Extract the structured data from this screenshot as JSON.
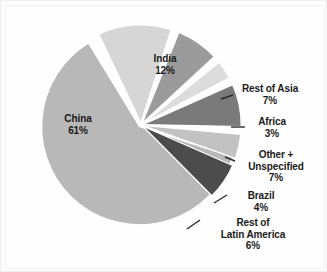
{
  "chart_data": {
    "type": "pie",
    "title": "",
    "subtitle": "",
    "xlabel": "",
    "ylabel": "",
    "legend_position": "none",
    "grid": false,
    "categories": [
      "China",
      "India",
      "Rest of Asia",
      "Africa",
      "Other + Unspecified",
      "Brazil",
      "Rest of Latin America"
    ],
    "values": [
      61,
      12,
      7,
      3,
      7,
      4,
      6
    ],
    "unit": "%",
    "slices": [
      {
        "label": "China",
        "value": 61,
        "value_text": "61%",
        "color": "#b8b8b8",
        "start_deg": 108,
        "end_deg": 328.6
      },
      {
        "label": "India",
        "value": 12,
        "value_text": "12%",
        "color": "#d6d6d6",
        "start_deg": 334.6,
        "end_deg": 378.0
      },
      {
        "label": "Rest of Asia",
        "value": 7,
        "value_text": "7%",
        "color": "#9b9b9b",
        "start_deg": 382.0,
        "end_deg": 407.2
      },
      {
        "label": "Africa",
        "value": 3,
        "value_text": "3%",
        "color": "#dcdcdc",
        "start_deg": 411.2,
        "end_deg": 422.0
      },
      {
        "label": "Other + Unspecified",
        "value": 7,
        "value_text": "7%",
        "color": "#7a7a7a",
        "start_deg": 426.0,
        "end_deg": 451.2
      },
      {
        "label": "Brazil",
        "value": 4,
        "value_text": "4%",
        "color": "#c2c2c2",
        "start_deg": 455.2,
        "end_deg": 469.6
      },
      {
        "label": "Rest of Latin America",
        "value": 6,
        "value_text": "6%",
        "color": "#4c4c4c",
        "start_deg": 473.6,
        "end_deg": 495.2
      }
    ]
  },
  "labels": {
    "china": {
      "name": "China",
      "pct": "61%"
    },
    "india": {
      "name": "India",
      "pct": "12%"
    },
    "rest_of_asia": {
      "name": "Rest of Asia",
      "pct": "7%"
    },
    "africa": {
      "name": "Africa",
      "pct": "3%"
    },
    "other": {
      "name_line1": "Other +",
      "name_line2": "Unspecified",
      "pct": "7%"
    },
    "brazil": {
      "name": "Brazil",
      "pct": "4%"
    },
    "rest_latin": {
      "name_line1": "Rest of",
      "name_line2": "Latin America",
      "pct": "6%"
    }
  },
  "colors": {
    "background": "#fdfdfd",
    "text": "#1a1a1a",
    "leader_line": "#2a2a2a",
    "gap": "#ffffff"
  }
}
